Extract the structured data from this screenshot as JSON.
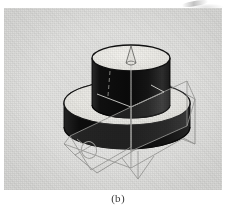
{
  "figure": {
    "caption": "(b)",
    "panel_background": "#e3e3e1",
    "ink_color": "#111111",
    "wireframe_color": "#8c8c8c",
    "highlight_color": "#f2f1ee"
  },
  "scene": {
    "title": "3D solid model with intersecting section planes",
    "view": "isometric",
    "parts": [
      {
        "name": "cylindrical-boss",
        "shape": "cylinder",
        "top_face_shade": "#efeeea",
        "side_face_shade": "#141414",
        "top_center": [
          131,
          58
        ],
        "top_radius": [
          39,
          13
        ],
        "height": 56
      },
      {
        "name": "base-flange",
        "shape": "disc",
        "top_face_shade": "#e8e7e3",
        "side_face_shade": "#131313",
        "top_center": [
          127,
          103
        ],
        "top_radius": [
          63,
          22
        ],
        "height": 33
      },
      {
        "name": "section-plane-left",
        "shape": "quadrilateral",
        "style": "wireframe",
        "stroke": "#8d8d8d"
      },
      {
        "name": "section-plane-right",
        "shape": "quadrilateral",
        "style": "wireframe",
        "stroke": "#8d8d8d"
      },
      {
        "name": "axis-arrow-marker",
        "shape": "cone",
        "style": "wireframe",
        "stroke": "#6f6f6f",
        "position": [
          131,
          55
        ]
      },
      {
        "name": "rotation-marker",
        "shape": "ellipse",
        "style": "wireframe",
        "stroke": "#8d8d8d",
        "position": [
          88,
          148
        ]
      }
    ]
  }
}
